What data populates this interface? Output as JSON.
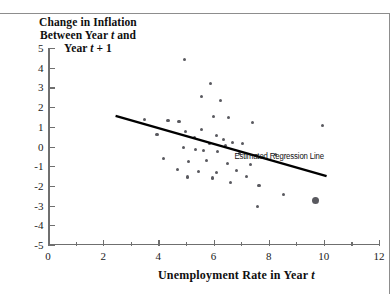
{
  "chart_data": {
    "type": "scatter",
    "title_lines": [
      "Change in Inflation",
      "Between Year t and",
      "Year t + 1"
    ],
    "xlabel": "Unemployment Rate in Year t",
    "ylabel": "Change in Inflation Between Year t and Year t + 1",
    "xlim": [
      0,
      12
    ],
    "ylim": [
      -5,
      5
    ],
    "xticks": [
      0,
      2,
      4,
      6,
      8,
      10,
      12
    ],
    "yticks": [
      5,
      4,
      3,
      2,
      1,
      0,
      -1,
      -2,
      -3,
      -4,
      -5
    ],
    "xtick_labels": [
      "0",
      "2",
      "4",
      "6",
      "8",
      "10",
      "12"
    ],
    "ytick_labels": [
      "5",
      "4",
      "3",
      "2",
      "1",
      "0",
      "-1",
      "-2",
      "-3",
      "-4",
      "-5"
    ],
    "x_minor_ticks": [
      1,
      3,
      5,
      7,
      9,
      11
    ],
    "grid": false,
    "legend": false,
    "point_color": "#59595f",
    "line_color": "#000000",
    "annotations": [
      {
        "text": "Estimated Regression Line",
        "x": 10.0,
        "y": -0.55
      }
    ],
    "regression_line": {
      "label": "Estimated Regression Line",
      "x_start": 2.45,
      "y_start": 1.55,
      "x_end": 10.1,
      "y_end": -1.5
    },
    "highlight_point": {
      "x": 9.7,
      "y": -2.75,
      "note": "enlarged marker"
    },
    "points": [
      {
        "x": 4.95,
        "y": 4.4
      },
      {
        "x": 5.9,
        "y": 3.2
      },
      {
        "x": 5.55,
        "y": 2.55
      },
      {
        "x": 6.25,
        "y": 2.35
      },
      {
        "x": 3.5,
        "y": 1.35
      },
      {
        "x": 4.35,
        "y": 1.3
      },
      {
        "x": 4.75,
        "y": 1.25
      },
      {
        "x": 6.0,
        "y": 1.5
      },
      {
        "x": 6.55,
        "y": 1.45
      },
      {
        "x": 7.4,
        "y": 1.2
      },
      {
        "x": 9.95,
        "y": 1.05
      },
      {
        "x": 5.0,
        "y": 0.75
      },
      {
        "x": 5.55,
        "y": 0.85
      },
      {
        "x": 3.95,
        "y": 0.6
      },
      {
        "x": 5.3,
        "y": 0.45
      },
      {
        "x": 6.1,
        "y": 0.55
      },
      {
        "x": 6.35,
        "y": 0.35
      },
      {
        "x": 5.85,
        "y": 0.15
      },
      {
        "x": 6.45,
        "y": 0.05
      },
      {
        "x": 6.7,
        "y": 0.2
      },
      {
        "x": 7.05,
        "y": 0.15
      },
      {
        "x": 4.9,
        "y": -0.05
      },
      {
        "x": 5.35,
        "y": -0.15
      },
      {
        "x": 5.65,
        "y": -0.2
      },
      {
        "x": 6.15,
        "y": -0.25
      },
      {
        "x": 6.95,
        "y": -0.35
      },
      {
        "x": 7.55,
        "y": -0.45
      },
      {
        "x": 8.25,
        "y": -0.4
      },
      {
        "x": 4.2,
        "y": -0.6
      },
      {
        "x": 5.1,
        "y": -0.75
      },
      {
        "x": 5.75,
        "y": -0.7
      },
      {
        "x": 6.5,
        "y": -0.85
      },
      {
        "x": 7.35,
        "y": -0.9
      },
      {
        "x": 4.7,
        "y": -1.15
      },
      {
        "x": 5.45,
        "y": -1.25
      },
      {
        "x": 6.1,
        "y": -1.3
      },
      {
        "x": 6.85,
        "y": -1.2
      },
      {
        "x": 5.05,
        "y": -1.55
      },
      {
        "x": 5.95,
        "y": -1.6
      },
      {
        "x": 7.2,
        "y": -1.5
      },
      {
        "x": 6.6,
        "y": -1.85
      },
      {
        "x": 7.65,
        "y": -2.0
      },
      {
        "x": 8.55,
        "y": -2.45
      },
      {
        "x": 7.6,
        "y": -3.05
      },
      {
        "x": 9.7,
        "y": -2.75,
        "highlight": true
      }
    ]
  }
}
